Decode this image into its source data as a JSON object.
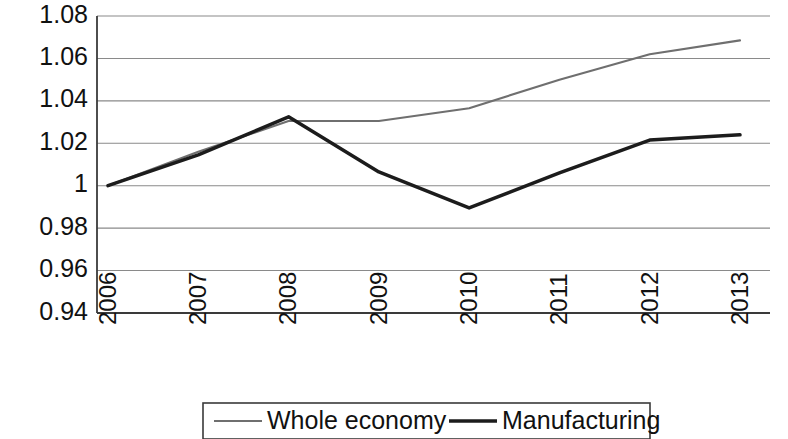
{
  "chart_data": {
    "type": "line",
    "title": "",
    "subtitle": "",
    "xlabel": "",
    "ylabel": "",
    "categories": [
      "2006",
      "2007",
      "2008",
      "2009",
      "2010",
      "2011",
      "2012",
      "2013"
    ],
    "series": [
      {
        "name": "Whole economy",
        "values": [
          1.0,
          1.016,
          1.0305,
          1.0305,
          1.0365,
          1.05,
          1.062,
          1.0685
        ],
        "color": "#6f6f6f",
        "line_width": "thin"
      },
      {
        "name": "Manufacturing",
        "values": [
          1.0,
          1.0145,
          1.0325,
          1.0065,
          0.9895,
          1.006,
          1.0215,
          1.024
        ],
        "color": "#1c1c1c",
        "line_width": "thick"
      }
    ],
    "ylim": [
      0.94,
      1.08
    ],
    "ytick_labels": [
      "1.08",
      "1.06",
      "1.04",
      "1.02",
      "1",
      "0.98",
      "0.96",
      "0.94"
    ],
    "ytick_values": [
      1.08,
      1.06,
      1.04,
      1.02,
      1.0,
      0.98,
      0.96,
      0.94
    ],
    "grid": true,
    "grid_axis": "y",
    "legend_position": "bottom",
    "xtick_rotation": -90
  },
  "legend": {
    "entries": [
      {
        "label": "Whole economy"
      },
      {
        "label": "Manufacturing"
      }
    ]
  }
}
